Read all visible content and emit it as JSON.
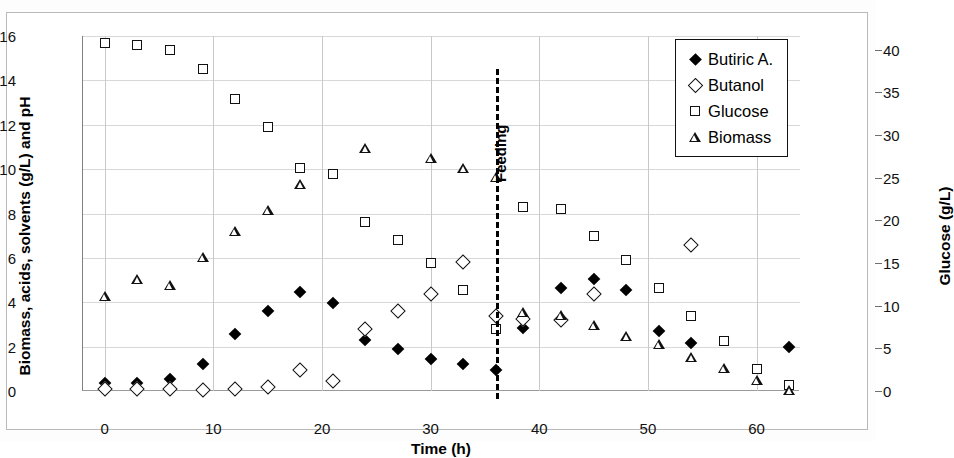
{
  "chart_data": {
    "type": "scatter",
    "title": "",
    "xlabel": "Time (h)",
    "ylabel": "Biomass, acids, solvents (g/L) and pH",
    "y2label": "Glucose (g/L)",
    "xlim": [
      -2,
      64
    ],
    "ylim": [
      0,
      16
    ],
    "y2lim": [
      0,
      41.6
    ],
    "xticks": [
      0,
      10,
      20,
      30,
      40,
      50,
      60
    ],
    "yticks": [
      0,
      2,
      4,
      6,
      8,
      10,
      12,
      14,
      16
    ],
    "y2ticks": [
      0,
      5,
      10,
      15,
      20,
      25,
      30,
      35,
      40
    ],
    "grid": true,
    "legend_position": "top-right",
    "annotations": [
      {
        "text": "Feeding",
        "x": 36,
        "style": "vertical-dashed-line"
      }
    ],
    "series": [
      {
        "name": "Butiric A.",
        "marker": "filled-diamond",
        "axis": "left",
        "x": [
          0,
          3,
          6,
          9,
          12,
          15,
          18,
          21,
          24,
          27,
          30,
          33,
          36,
          38.5,
          42,
          45,
          48,
          51,
          54,
          63
        ],
        "values": [
          0.35,
          0.35,
          0.55,
          1.2,
          2.55,
          3.6,
          4.45,
          3.95,
          2.3,
          1.9,
          1.45,
          1.2,
          0.95,
          2.85,
          4.65,
          5.05,
          4.55,
          2.7,
          2.15,
          2.0
        ]
      },
      {
        "name": "Butanol",
        "marker": "open-diamond",
        "axis": "left",
        "x": [
          0,
          3,
          6,
          9,
          12,
          15,
          18,
          21,
          24,
          27,
          30,
          33,
          36,
          38.5,
          42,
          45,
          54
        ],
        "values": [
          0.1,
          0.1,
          0.1,
          0.05,
          0.1,
          0.2,
          0.95,
          0.45,
          2.8,
          3.6,
          4.35,
          5.8,
          3.4,
          3.25,
          3.2,
          4.35,
          6.6
        ]
      },
      {
        "name": "Glucose",
        "marker": "open-square",
        "axis": "right",
        "x": [
          0,
          3,
          6,
          9,
          12,
          15,
          18,
          21,
          24,
          27,
          30,
          33,
          36,
          38.5,
          42,
          45,
          48,
          51,
          54,
          57,
          60,
          63
        ],
        "values_g_per_L": [
          40.8,
          40.6,
          39.9,
          37.7,
          34.2,
          30.9,
          26.1,
          25.5,
          19.8,
          17.7,
          15.0,
          11.9,
          7.3,
          21.6,
          21.3,
          18.2,
          15.3,
          12.1,
          8.8,
          5.8,
          2.6,
          0.7
        ],
        "values_left_scale": [
          15.7,
          15.6,
          15.35,
          14.5,
          13.15,
          11.9,
          10.05,
          9.8,
          7.6,
          6.8,
          5.75,
          4.55,
          2.8,
          8.3,
          8.2,
          7.0,
          5.9,
          4.65,
          3.4,
          2.25,
          1.0,
          0.25
        ]
      },
      {
        "name": "Biomass",
        "marker": "open-triangle",
        "axis": "left",
        "x": [
          0,
          3,
          6,
          9,
          12,
          15,
          18,
          24,
          30,
          33,
          36,
          38.5,
          42,
          45,
          48,
          51,
          54,
          57,
          60,
          63
        ],
        "values": [
          4.3,
          5.5,
          5.7,
          7.4,
          9.0,
          10.4,
          12.05,
          14.1,
          14.1,
          14.1,
          14.15,
          8.5,
          8.85,
          8.85,
          8.8,
          8.9,
          8.75,
          8.7,
          8.6,
          8.6
        ]
      }
    ]
  },
  "legend": {
    "items": [
      {
        "label": "Butiric A.",
        "marker": "filled-diamond"
      },
      {
        "label": "Butanol",
        "marker": "open-diamond"
      },
      {
        "label": "Glucose",
        "marker": "open-square"
      },
      {
        "label": "Biomass",
        "marker": "open-triangle"
      }
    ]
  },
  "axes": {
    "x_label": "Time (h)",
    "y_left_label": "Biomass, acids, solvents (g/L) and pH",
    "y_right_label": "Glucose (g/L)",
    "x_tick_labels": [
      "0",
      "10",
      "20",
      "30",
      "40",
      "50",
      "60"
    ],
    "y_left_tick_labels": [
      "0",
      "2",
      "4",
      "6",
      "8",
      "10",
      "12",
      "14",
      "16"
    ],
    "y_right_tick_labels": [
      "0",
      "5",
      "10",
      "15",
      "20",
      "25",
      "30",
      "35",
      "40"
    ]
  },
  "annotation": {
    "feeding_label": "Feeding"
  },
  "colors": {
    "marker": "#111111",
    "grid": "#d8d8d8",
    "axis": "#808080",
    "frame": "#b9b9b9"
  }
}
